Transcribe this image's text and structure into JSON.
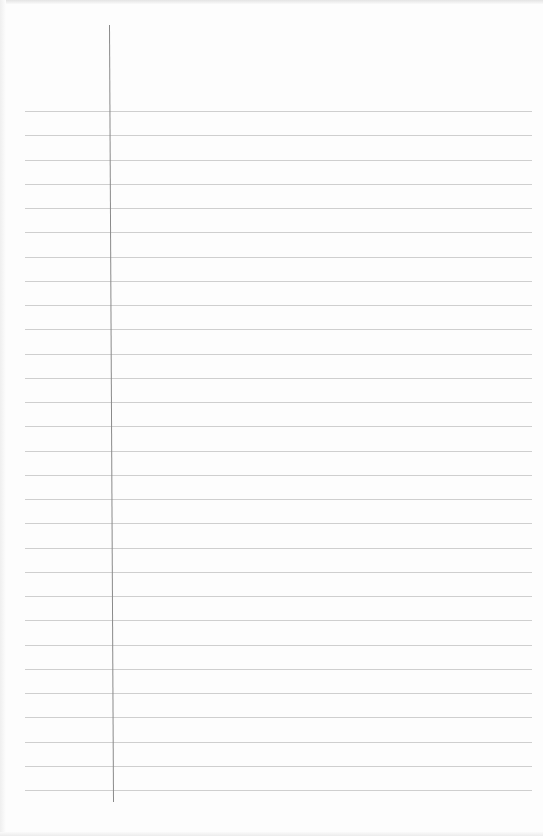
{
  "page": {
    "type": "blank lined paper",
    "background_color": "#fdfdfd",
    "rule_color": "#cfcfcf",
    "margin_color": "#8a8a8a",
    "rules": {
      "count": 29,
      "first_y": 111,
      "spacing": 24.25,
      "x_start": 25,
      "x_end": 532
    },
    "margin_line": {
      "x_top": 109,
      "x_bottom": 113,
      "y_start": 25,
      "y_end": 802
    }
  }
}
